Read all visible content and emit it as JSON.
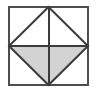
{
  "figure": {
    "type": "geometric-diagram",
    "canvas": {
      "width": 99,
      "height": 93
    },
    "background_color": "#ffffff",
    "stroke_color": "#4d4d4d",
    "inner_stroke_color": "#3c3c3c",
    "shade_color": "#d3d3d3",
    "square": {
      "name": "outer-square",
      "left": 9,
      "top": 7,
      "right": 88,
      "bottom": 85,
      "width": 79,
      "height": 78,
      "stroke_width": 2,
      "fill": "none"
    },
    "rhombus": {
      "name": "inscribed-rhombus",
      "vertices": [
        {
          "label": "top",
          "x": 48.5,
          "y": 7
        },
        {
          "label": "right",
          "x": 88,
          "y": 46
        },
        {
          "label": "bottom",
          "x": 48.5,
          "y": 85
        },
        {
          "label": "left",
          "x": 9,
          "y": 46
        }
      ],
      "stroke_width": 2
    },
    "diagonals": [
      {
        "name": "vertical-diagonal",
        "x1": 48.5,
        "y1": 7,
        "x2": 48.5,
        "y2": 85
      },
      {
        "name": "horizontal-diagonal",
        "x1": 9,
        "y1": 46,
        "x2": 88,
        "y2": 46
      }
    ],
    "shaded_regions": [
      {
        "name": "lower-left-triangle",
        "points": "9,46 48.5,46 48.5,85",
        "fill": "#d3d3d3"
      },
      {
        "name": "lower-right-triangle",
        "points": "48.5,46 88,46 48.5,85",
        "fill": "#d3d3d3"
      }
    ],
    "unshaded_regions": [
      {
        "name": "upper-left-triangle",
        "points": "9,46 48.5,46 48.5,7",
        "fill": "#ffffff"
      },
      {
        "name": "upper-right-triangle",
        "points": "48.5,46 88,46 48.5,7",
        "fill": "#ffffff"
      },
      {
        "name": "corner-top-left",
        "points": "9,7 48.5,7 9,46",
        "fill": "#ffffff"
      },
      {
        "name": "corner-top-right",
        "points": "48.5,7 88,7 88,46",
        "fill": "#ffffff"
      },
      {
        "name": "corner-bottom-left",
        "points": "9,46 48.5,85 9,85",
        "fill": "#ffffff"
      },
      {
        "name": "corner-bottom-right",
        "points": "88,46 88,85 48.5,85",
        "fill": "#ffffff"
      }
    ]
  }
}
